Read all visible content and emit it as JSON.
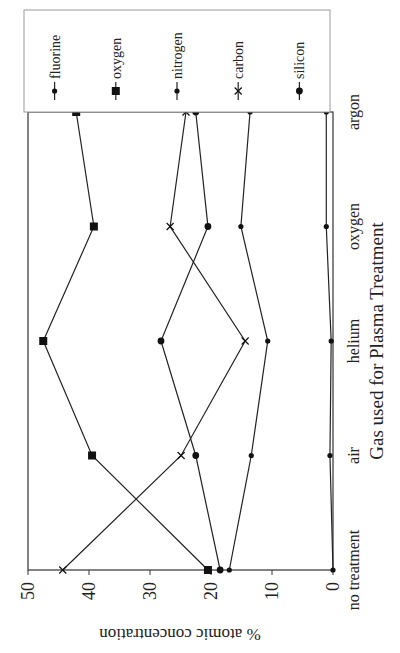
{
  "chart_data": {
    "type": "line",
    "orientation": "figure rotated 90deg counter-clockwise",
    "title": "",
    "xlabel": "Gas used for Plasma Treatment",
    "ylabel": "% atomic concentration",
    "categories": [
      "no treatment",
      "air",
      "helium",
      "oxygen",
      "argon"
    ],
    "ylim": [
      0,
      50
    ],
    "yticks": [
      0,
      10,
      20,
      30,
      40,
      50
    ],
    "grid": false,
    "legend_position": "right (top of rotated image)",
    "series": [
      {
        "name": "fluorine",
        "marker": "small-dot",
        "values": [
          0,
          0.5,
          0.3,
          1.1,
          1.1
        ]
      },
      {
        "name": "oxygen",
        "marker": "square",
        "values": [
          20.5,
          39.5,
          47.5,
          39.2,
          42.1
        ]
      },
      {
        "name": "nitrogen",
        "marker": "small-dot",
        "values": [
          17,
          13.4,
          10.7,
          15.1,
          13.6
        ]
      },
      {
        "name": "carbon",
        "marker": "x",
        "values": [
          44.3,
          24.9,
          14.4,
          26.7,
          24.1
        ]
      },
      {
        "name": "silicon",
        "marker": "dot",
        "values": [
          18.5,
          22.5,
          28.2,
          20.5,
          22.5
        ]
      }
    ]
  }
}
